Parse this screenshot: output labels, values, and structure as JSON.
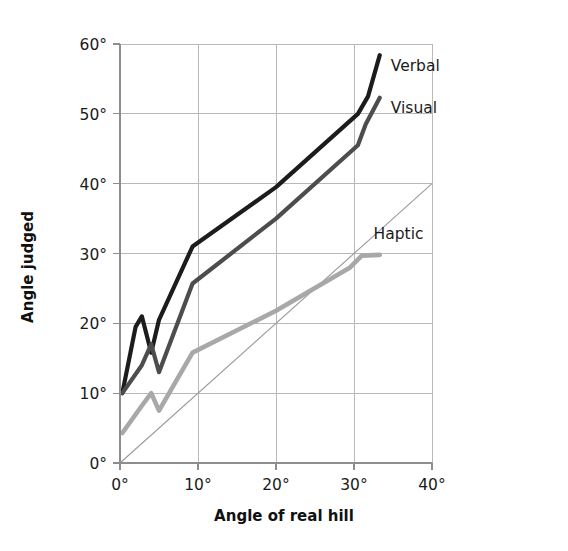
{
  "chart_data": {
    "type": "line",
    "title": "",
    "xlabel": "Angle of real hill",
    "ylabel": "Angle judged",
    "xlim": [
      0,
      40
    ],
    "ylim": [
      0,
      60
    ],
    "xticks": [
      "0°",
      "10°",
      "20°",
      "30°",
      "40°"
    ],
    "xtick_values": [
      0,
      10,
      20,
      30,
      40
    ],
    "yticks": [
      "0°",
      "10°",
      "20°",
      "30°",
      "40°",
      "50°",
      "60°"
    ],
    "ytick_values": [
      0,
      10,
      20,
      30,
      40,
      50,
      60
    ],
    "grid": true,
    "legend_position": "inline-right",
    "series": [
      {
        "name": "Verbal",
        "color": "#1c1c1c",
        "width": 4.2,
        "x": [
          0.3,
          2.0,
          2.8,
          4.0,
          5.0,
          9.3,
          20.0,
          30.5,
          31.8,
          33.3
        ],
        "y": [
          10.0,
          19.5,
          21.0,
          15.8,
          20.5,
          31.0,
          39.5,
          50.0,
          52.5,
          58.4
        ]
      },
      {
        "name": "Visual",
        "color": "#4d4d4d",
        "width": 4.2,
        "x": [
          0.3,
          2.8,
          4.0,
          5.0,
          9.3,
          20.0,
          30.5,
          31.5,
          33.3
        ],
        "y": [
          10.0,
          14.0,
          17.0,
          13.0,
          25.7,
          35.0,
          45.5,
          48.5,
          52.3
        ]
      },
      {
        "name": "Haptic",
        "color": "#a8a8a8",
        "width": 4.6,
        "x": [
          0.3,
          2.8,
          4.0,
          5.0,
          9.3,
          20.0,
          29.5,
          31.0,
          33.3
        ],
        "y": [
          4.3,
          8.2,
          10.0,
          7.5,
          15.8,
          21.8,
          28.0,
          29.7,
          29.8
        ]
      }
    ],
    "reference_line": {
      "name": "identity",
      "color": "#9a9a9a",
      "x": [
        0,
        40
      ],
      "y": [
        0,
        40
      ]
    },
    "annotations": [
      {
        "text": "Verbal",
        "x": 34.2,
        "y": 57.0
      },
      {
        "text": "Visual",
        "x": 34.2,
        "y": 51.0
      },
      {
        "text": "Haptic",
        "x": 32.0,
        "y": 33.0
      }
    ]
  }
}
